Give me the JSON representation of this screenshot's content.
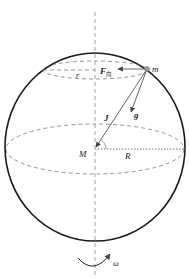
{
  "diagram": {
    "labels": {
      "mass": "m",
      "planet_mass": "M",
      "planet_radius": "R",
      "latitude_radius": "r",
      "centripetal_force": "F",
      "centripetal_force_sub": "向",
      "gravitation": "J",
      "gravity": "g",
      "angular_velocity": "ω"
    },
    "colors": {
      "outline": "#1a1a1a",
      "dashed": "#7a7a7a",
      "vector": "#555555",
      "point": "#9a9a9a"
    }
  }
}
